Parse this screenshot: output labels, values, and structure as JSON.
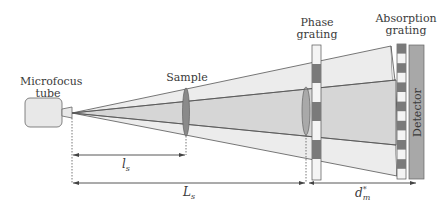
{
  "labels": {
    "source_line1": "Microfocus",
    "source_line2": "tube",
    "sample": "Sample",
    "phase_line1": "Phase",
    "phase_line2": "grating",
    "absorption_line1": "Absorption",
    "absorption_line2": "grating",
    "detector": "Detector"
  },
  "dimensions": {
    "ls_main": "l",
    "ls_sub": "s",
    "Ls_main": "L",
    "Ls_sub": "s",
    "dm_main": "d",
    "dm_sub": "m",
    "dm_sup": "*"
  },
  "colors": {
    "outer_beam": "#ececec",
    "inner_beam": "#d6d6d6",
    "tube_fill": "#e8e8e8",
    "grating_dark": "#7a7a7a",
    "grating_light": "#f4f4f4",
    "detector_fill": "#a8a8a8",
    "sample_fill": "#8a8a8a",
    "line": "#555555"
  }
}
